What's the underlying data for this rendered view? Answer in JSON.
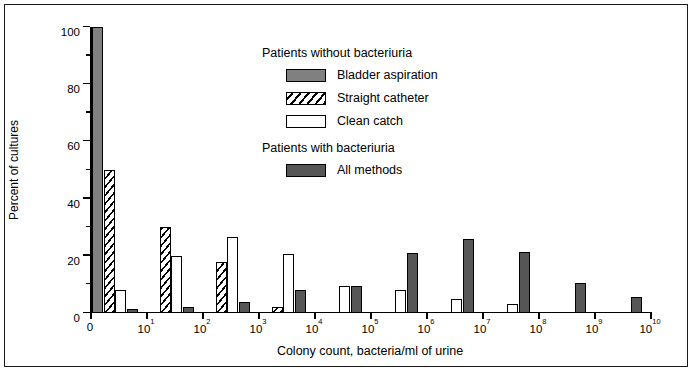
{
  "chart_data": {
    "type": "bar",
    "title": "",
    "xlabel": "Colony count, bacteria/ml of urine",
    "ylabel": "Percent of cultures",
    "ylim": [
      0,
      100
    ],
    "yticks": [
      0,
      20,
      40,
      60,
      80,
      100
    ],
    "yticklabels": [
      "0",
      "20",
      "40",
      "60",
      "80",
      "100"
    ],
    "yminorticks": [
      10,
      30,
      50,
      70,
      90
    ],
    "grid": false,
    "legend_position": "upper-center-right",
    "x_scale": "log-categorical",
    "categories": [
      "0",
      "10^1",
      "10^2",
      "10^3",
      "10^4",
      "10^5",
      "10^6",
      "10^7",
      "10^8",
      "10^9"
    ],
    "xticklabels": [
      "0",
      "10¹",
      "10²",
      "10³",
      "10⁴",
      "10⁵",
      "10⁶",
      "10⁷",
      "10⁸",
      "10⁹",
      "10¹⁰"
    ],
    "series": [
      {
        "name": "Bladder aspiration",
        "group": "Patients without bacteriuria",
        "fill": "solid-gray",
        "color": "#808080",
        "values": [
          100,
          0,
          0,
          0,
          0,
          0,
          0,
          0,
          0,
          0
        ]
      },
      {
        "name": "Straight catheter",
        "group": "Patients without bacteriuria",
        "fill": "diagonal-hatch",
        "color": "#ffffff",
        "values": [
          50,
          30,
          18,
          2,
          0,
          0,
          0,
          0,
          0,
          0
        ]
      },
      {
        "name": "Clean catch",
        "group": "Patients without bacteriuria",
        "fill": "open-white",
        "color": "#ffffff",
        "values": [
          8,
          20,
          26.5,
          20.5,
          9.5,
          8,
          5,
          3,
          0,
          0
        ]
      },
      {
        "name": "All methods",
        "group": "Patients with bacteriuria",
        "fill": "solid-darkgray",
        "color": "#565656",
        "values": [
          1.5,
          2,
          4,
          8,
          9.5,
          21,
          26,
          21.5,
          10.5,
          5.5
        ]
      }
    ]
  },
  "axes": {
    "ylabel": "Percent of cultures",
    "xlabel": "Colony count, bacteria/ml of urine"
  },
  "legend": {
    "groups": [
      {
        "title": "Patients without bacteriuria",
        "entries": [
          {
            "label": "Bladder aspiration",
            "style": "s-aspiration"
          },
          {
            "label": "Straight catheter",
            "style": "s-catheter"
          },
          {
            "label": "Clean catch",
            "style": "s-cleancatch"
          }
        ]
      },
      {
        "title": "Patients with bacteriuria",
        "entries": [
          {
            "label": "All methods",
            "style": "s-allmethods"
          }
        ]
      }
    ]
  },
  "colors": {
    "aspiration": "#808080",
    "all_methods": "#565656",
    "clean_catch": "#ffffff",
    "outline": "#000000",
    "frame": "#1a1a1a"
  }
}
